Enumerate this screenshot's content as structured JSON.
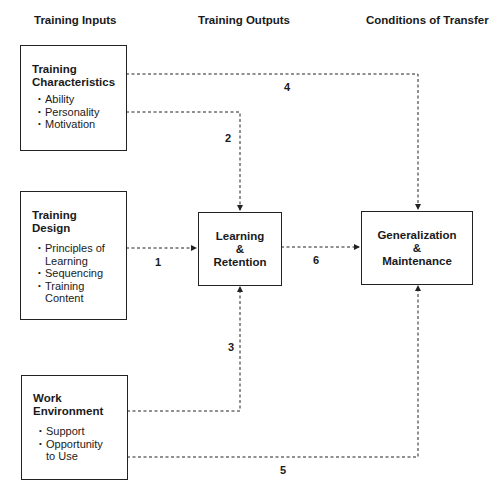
{
  "columns": {
    "inputs": "Training Inputs",
    "outputs": "Training Outputs",
    "conditions": "Conditions of Transfer"
  },
  "boxes": {
    "characteristics": {
      "title_line1": "Training",
      "title_line2": "Characteristics",
      "items": [
        "Ability",
        "Personality",
        "Motivation"
      ]
    },
    "design": {
      "title_line1": "Training",
      "title_line2": "Design",
      "items": [
        "Principles of Learning",
        "Sequencing",
        "Training Content"
      ]
    },
    "environment": {
      "title_line1": "Work",
      "title_line2": "Environment",
      "items": [
        "Support",
        "Opportunity to Use"
      ]
    },
    "learning": {
      "line1": "Learning",
      "line2": "&",
      "line3": "Retention"
    },
    "generalization": {
      "line1": "Generalization",
      "line2": "&",
      "line3": "Maintenance"
    }
  },
  "links": {
    "l1": "1",
    "l2": "2",
    "l3": "3",
    "l4": "4",
    "l5": "5",
    "l6": "6"
  },
  "colors": {
    "line": "#222222",
    "background": "#ffffff"
  }
}
